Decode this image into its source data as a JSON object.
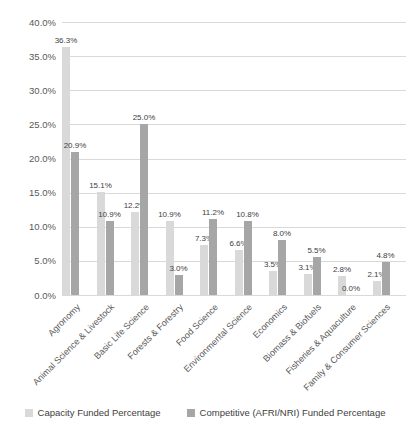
{
  "chart_data": {
    "type": "bar",
    "title": "",
    "xlabel": "",
    "ylabel": "",
    "categories": [
      "Agronomy",
      "Animal Science & Livestock",
      "Basic Life Science",
      "Forests & Forestry",
      "Food Science",
      "Environmental Science",
      "Economics",
      "Biomass & Biofuels",
      "Fisheries & Aquaculture",
      "Family & Consumer Sciences"
    ],
    "series": [
      {
        "name": "Capacity Funded Percentage",
        "color": "#d9d9d9",
        "values": [
          36.3,
          15.1,
          12.2,
          10.9,
          7.3,
          6.6,
          3.5,
          3.1,
          2.8,
          2.1
        ]
      },
      {
        "name": "Competitive (AFRI/NRI) Funded Percentage",
        "color": "#a6a6a6",
        "values": [
          20.9,
          10.9,
          25.0,
          3.0,
          11.2,
          10.8,
          8.0,
          5.5,
          0.0,
          4.8
        ]
      }
    ],
    "y_ticks": [
      "40.0%",
      "35.0%",
      "30.0%",
      "25.0%",
      "20.0%",
      "15.0%",
      "10.0%",
      "5.0%",
      "0.0%"
    ],
    "ylim": [
      0,
      40
    ],
    "y_tick_step": 5,
    "grid": true,
    "data_labels": true,
    "data_label_format": "0.0%",
    "legend_position": "bottom",
    "colors": {
      "gridline": "#d9d9d9",
      "axis_text": "#595959",
      "data_label_text": "#404040",
      "background": "#ffffff"
    }
  }
}
